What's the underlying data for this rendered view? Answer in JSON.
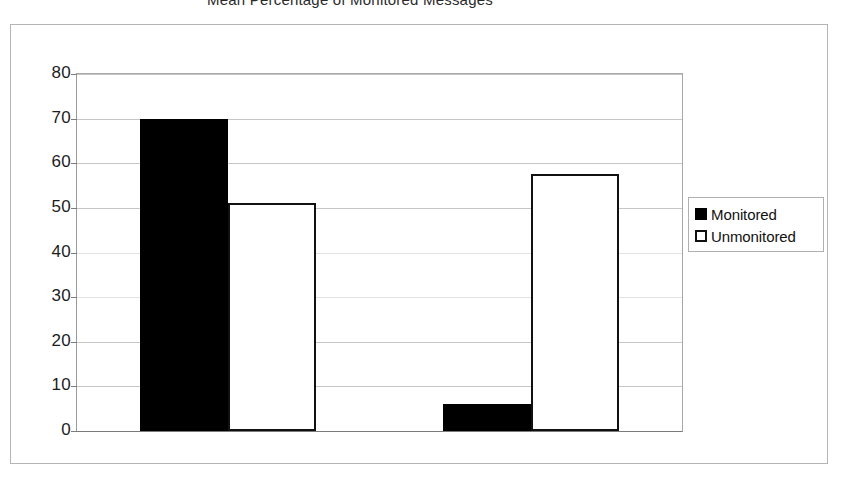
{
  "chart_data": {
    "type": "bar",
    "title": "Mean Percentage of Monitored Messages",
    "xlabel": "",
    "ylabel": "",
    "categories": [
      "Personal Content",
      "Conflictual Tone"
    ],
    "series": [
      {
        "name": "Monitored",
        "values": [
          70,
          6
        ]
      },
      {
        "name": "Unmonitored",
        "values": [
          51,
          57.5
        ]
      }
    ],
    "ylim": [
      0,
      80
    ],
    "ytick_step": 10,
    "ytick_labels": [
      "80",
      "70",
      "60",
      "50",
      "40",
      "30",
      "20",
      "10",
      "0"
    ],
    "ytick_values": [
      80,
      70,
      60,
      50,
      40,
      30,
      20,
      10,
      0
    ],
    "grid": true,
    "legend_position": "right",
    "colors": {
      "monitored": "#000000",
      "unmonitored": "#ffffff",
      "outline": "#111111",
      "gridline": "#c6c6c6",
      "frame": "#b4b4b4"
    }
  },
  "legend": {
    "entries": [
      {
        "label": "Monitored",
        "swatch": "filled-square-icon"
      },
      {
        "label": "Unmonitored",
        "swatch": "hollow-square-icon"
      }
    ]
  }
}
